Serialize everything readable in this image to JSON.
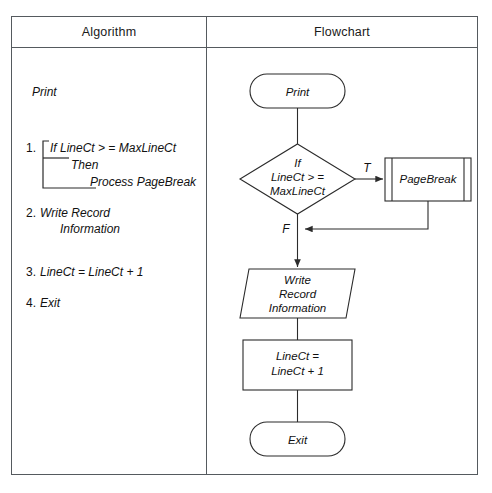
{
  "table": {
    "headers": {
      "algorithm": "Algorithm",
      "flowchart": "Flowchart"
    }
  },
  "algorithm": {
    "intro": "Print",
    "steps": [
      {
        "number": "1.",
        "lines": [
          "If LineCt > = MaxLineCt",
          "Then",
          "Process PageBreak"
        ]
      },
      {
        "number": "2.",
        "lines": [
          "Write Record",
          "Information"
        ]
      },
      {
        "number": "3.",
        "lines": [
          "LineCt = LineCt + 1"
        ]
      },
      {
        "number": "4.",
        "lines": [
          "Exit"
        ]
      }
    ]
  },
  "flowchart": {
    "nodes": [
      {
        "id": "start",
        "type": "terminator",
        "label": "Print"
      },
      {
        "id": "decision",
        "type": "decision",
        "label_line1": "If",
        "label_line2": "LineCt > =",
        "label_line3": "MaxLineCt"
      },
      {
        "id": "pagebreak",
        "type": "predefined-process",
        "label": "PageBreak"
      },
      {
        "id": "write",
        "type": "input-output",
        "label_line1": "Write",
        "label_line2": "Record",
        "label_line3": "Information"
      },
      {
        "id": "increment",
        "type": "process",
        "label_line1": "LineCt =",
        "label_line2": "LineCt + 1"
      },
      {
        "id": "end",
        "type": "terminator",
        "label": "Exit"
      }
    ],
    "edge_labels": {
      "true": "T",
      "false": "F"
    }
  },
  "colors": {
    "stroke": "#2b2b2b",
    "table_border": "#555a5e",
    "background": "#ffffff",
    "text": "#111111"
  }
}
